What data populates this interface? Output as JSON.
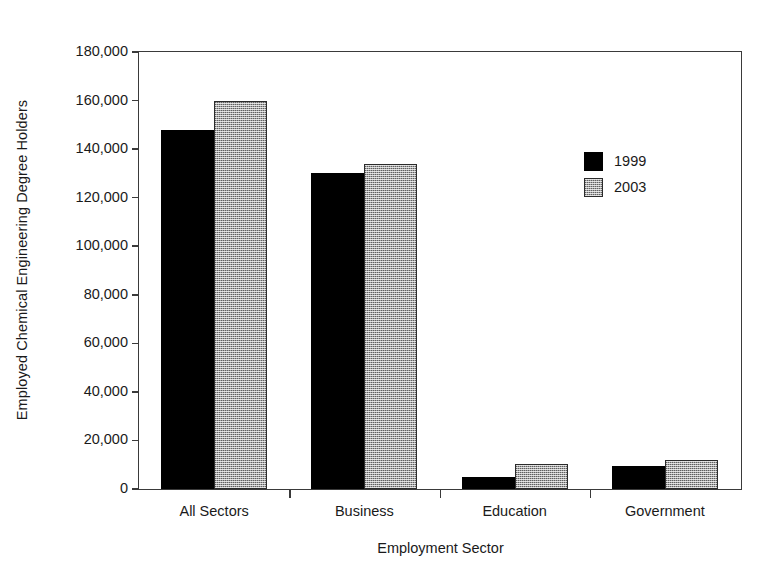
{
  "chart_data": {
    "type": "bar",
    "title": "",
    "xlabel": "Employment Sector",
    "ylabel": "Employed Chemical Engineering Degree Holders",
    "categories": [
      "All Sectors",
      "Business",
      "Education",
      "Government"
    ],
    "series": [
      {
        "name": "1999",
        "color": "#000000",
        "values": [
          148000,
          130000,
          5000,
          9500
        ]
      },
      {
        "name": "2003",
        "color": "#a5a5a5",
        "values": [
          160000,
          134000,
          10500,
          12000
        ]
      }
    ],
    "ylim": [
      0,
      180000
    ],
    "ytick_labels": [
      "180,000",
      "160,000",
      "140,000",
      "120,000",
      "100,000",
      "80,000",
      "60,000",
      "40,000",
      "20,000",
      "0"
    ],
    "ytick_values": [
      180000,
      160000,
      140000,
      120000,
      100000,
      80000,
      60000,
      40000,
      20000,
      0
    ],
    "grid": false,
    "legend_position": "inside-upper-right"
  }
}
